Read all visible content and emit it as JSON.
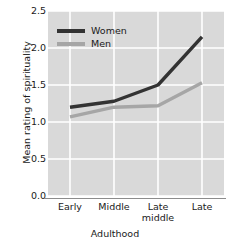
{
  "chart_data": {
    "type": "line",
    "title": "",
    "xlabel": "Adulthood",
    "ylabel": "Mean rating of spirituality",
    "categories": [
      "Early",
      "Middle",
      "Late\nmiddle",
      "Late"
    ],
    "category_labels": [
      {
        "line1": "Early",
        "line2": ""
      },
      {
        "line1": "Middle",
        "line2": ""
      },
      {
        "line1": "Late",
        "line2": "middle"
      },
      {
        "line1": "Late",
        "line2": ""
      }
    ],
    "yticks": [
      "2.5",
      "2.0",
      "1.5",
      "1.0",
      "0.5",
      "0.0"
    ],
    "ytick_values": [
      2.5,
      2.0,
      1.5,
      1.0,
      0.5,
      0.0
    ],
    "ylim": [
      0.0,
      2.5
    ],
    "grid": true,
    "grid_color": "#ffffff",
    "plot_background": "#d9d9d9",
    "legend_position": "upper left",
    "series": [
      {
        "name": "Women",
        "color": "#333333",
        "values": [
          1.2,
          1.28,
          1.5,
          2.15
        ]
      },
      {
        "name": "Men",
        "color": "#a6a6a6",
        "values": [
          1.07,
          1.2,
          1.22,
          1.53
        ]
      }
    ]
  },
  "legend": {
    "entries": [
      {
        "label": "Women",
        "color": "#333333"
      },
      {
        "label": "Men",
        "color": "#a6a6a6"
      }
    ]
  },
  "axes": {
    "x_title": "Adulthood",
    "y_title": "Mean rating of spirituality"
  }
}
